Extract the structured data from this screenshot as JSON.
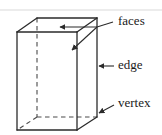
{
  "figure": {
    "background_color": "#ffffff",
    "stroke_color": "#2b2b2b",
    "text_color": "#1a1a1a",
    "top_rule_color": "#e3e3e3"
  },
  "solid": {
    "name": "rectangular prism",
    "projection": "oblique",
    "visible_edge_style": "solid",
    "hidden_edge_style": "dashed"
  },
  "labels": [
    {
      "id": "faces",
      "text": "faces",
      "icon": "leader-line-branching-two-arrows",
      "x": 118,
      "y": 22,
      "points_to": [
        "top face",
        "right face"
      ]
    },
    {
      "id": "edge",
      "text": "edge",
      "icon": "leader-line-left-arrow",
      "x": 118,
      "y": 66,
      "points_to": [
        "back right vertical edge"
      ]
    },
    {
      "id": "vertex",
      "text": "vertex",
      "icon": "leader-line-left-arrow",
      "x": 118,
      "y": 104,
      "points_to": [
        "back right bottom vertex"
      ]
    }
  ]
}
